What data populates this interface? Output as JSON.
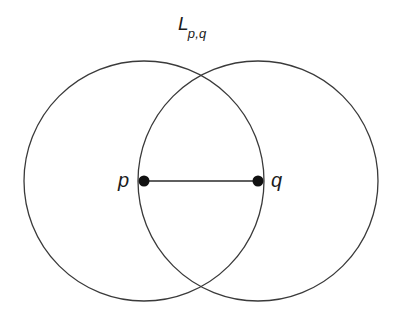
{
  "figure": {
    "background_color": "#ffffff",
    "stroke_color": "#3a3a3a",
    "point_color": "#111111",
    "labels": {
      "lens_label_base": "L",
      "lens_label_subscript": "p,q",
      "point_p_label": "p",
      "point_q_label": "q"
    },
    "geometry": {
      "circle_p": {
        "cx": 144,
        "cy": 181,
        "r": 120
      },
      "circle_q": {
        "cx": 258,
        "cy": 181,
        "r": 120
      },
      "segment": {
        "x1": 144,
        "y1": 181,
        "x2": 258,
        "y2": 181
      },
      "point_radius": 5.5
    }
  }
}
